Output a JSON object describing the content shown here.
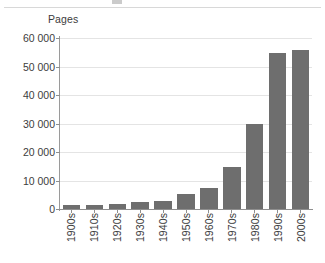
{
  "figure": {
    "axis_title": "Pages",
    "bar_color": "#6e6e6e",
    "grid_color": "#e4e4e4",
    "axis_color": "#8f8f8f",
    "text_color": "#3c3c3c",
    "background": "#ffffff"
  },
  "chart_data": {
    "type": "bar",
    "title": "",
    "subtitle": "",
    "xlabel": "",
    "ylabel": "Pages",
    "categories": [
      "1900s",
      "1910s",
      "1920s",
      "1930s",
      "1940s",
      "1950s",
      "1960s",
      "1970s",
      "1980s",
      "1990s",
      "2000s"
    ],
    "values": [
      1400,
      1300,
      1700,
      2600,
      2900,
      5400,
      7500,
      14800,
      29700,
      54800,
      55900
    ],
    "ylim": [
      0,
      60000
    ],
    "ytick_values": [
      0,
      10000,
      20000,
      30000,
      40000,
      50000,
      60000
    ],
    "ytick_labels": [
      "0",
      "10 000",
      "20 000",
      "30 000",
      "40 000",
      "50 000",
      "60 000"
    ],
    "grid": true,
    "grid_axis": "y",
    "legend": false,
    "legend_position": "none",
    "xtick_rotation": 90,
    "series": [
      {
        "name": "Pages",
        "values": [
          1400,
          1300,
          1700,
          2600,
          2900,
          5400,
          7500,
          14800,
          29700,
          54800,
          55900
        ]
      }
    ]
  }
}
